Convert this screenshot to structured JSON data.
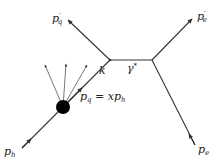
{
  "diagram": {
    "type": "feynman-diagram",
    "labels": {
      "incoming_hadron": {
        "base": "p",
        "sub": "h"
      },
      "incoming_quark": {
        "text": "p",
        "sub": "q",
        "rest": " = xp",
        "rest_sub": "h"
      },
      "outgoing_quark": {
        "base": "p",
        "prime": "′",
        "sub": "q"
      },
      "outgoing_electron": {
        "base": "p",
        "prime": "′",
        "sub": "e"
      },
      "incoming_electron": {
        "base": "p",
        "sub": "e"
      },
      "photon": {
        "base": "γ",
        "sup": "*"
      },
      "momentum_k": "k"
    },
    "colors": {
      "line": "#333333",
      "blob": "#000000",
      "text": "#222222"
    }
  }
}
